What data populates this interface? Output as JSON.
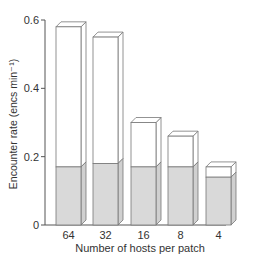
{
  "chart_data": {
    "type": "bar",
    "title": "",
    "xlabel": "Number of hosts per patch",
    "ylabel": "Encounter rate (encs min⁻¹)",
    "categories": [
      "64",
      "32",
      "16",
      "8",
      "4"
    ],
    "series": [
      {
        "name": "total",
        "values": [
          0.58,
          0.55,
          0.3,
          0.26,
          0.17
        ],
        "color": "#ffffff"
      },
      {
        "name": "shaded",
        "values": [
          0.17,
          0.18,
          0.17,
          0.17,
          0.14
        ],
        "color": "#d9d9d9"
      }
    ],
    "yticks": [
      "0",
      "0.2",
      "0.4",
      "0.6"
    ],
    "ylim": [
      0,
      0.6
    ],
    "grid": false,
    "legend": "none"
  }
}
